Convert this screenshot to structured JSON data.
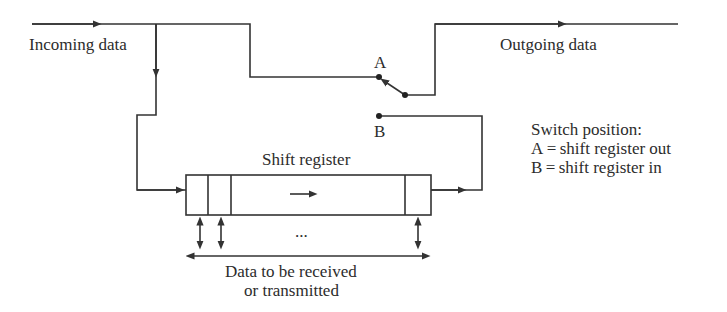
{
  "diagram": {
    "labels": {
      "incoming": "Incoming data",
      "outgoing": "Outgoing data",
      "switch_a": "A",
      "switch_b": "B",
      "shift_register": "Shift register",
      "ellipsis": "...",
      "data_line1": "Data to be received",
      "data_line2": "or transmitted"
    },
    "legend": {
      "title": "Switch position:",
      "items": [
        "A = shift register out",
        "B = shift register in"
      ]
    },
    "switch_state": "A",
    "colors": {
      "line": "#333333",
      "background": "#ffffff"
    }
  }
}
